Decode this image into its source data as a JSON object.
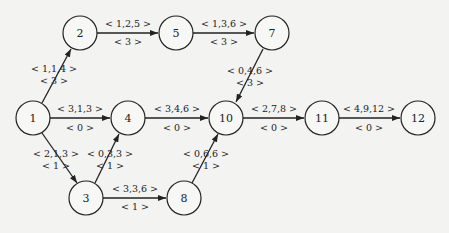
{
  "diagram": {
    "type": "activity-network",
    "nodes": [
      {
        "id": "1",
        "label": "1",
        "x": 33,
        "y": 118
      },
      {
        "id": "2",
        "label": "2",
        "x": 80,
        "y": 33
      },
      {
        "id": "3",
        "label": "3",
        "x": 86,
        "y": 198
      },
      {
        "id": "4",
        "label": "4",
        "x": 128,
        "y": 118
      },
      {
        "id": "5",
        "label": "5",
        "x": 176,
        "y": 33
      },
      {
        "id": "7",
        "label": "7",
        "x": 272,
        "y": 33
      },
      {
        "id": "8",
        "label": "8",
        "x": 184,
        "y": 198
      },
      {
        "id": "10",
        "label": "10",
        "x": 226,
        "y": 118
      },
      {
        "id": "11",
        "label": "11",
        "x": 322,
        "y": 118
      },
      {
        "id": "12",
        "label": "12",
        "x": 418,
        "y": 118
      }
    ],
    "edges": [
      {
        "from": "1",
        "to": "2",
        "label1": "< 1,1,4 >",
        "label2": "< 3 >"
      },
      {
        "from": "2",
        "to": "5",
        "label1": "< 1,2,5 >",
        "label2": "< 3 >"
      },
      {
        "from": "5",
        "to": "7",
        "label1": "< 1,3,6 >",
        "label2": "< 3 >"
      },
      {
        "from": "7",
        "to": "10",
        "label1": "< 0,4,6 >",
        "label2": "< 3 >"
      },
      {
        "from": "1",
        "to": "4",
        "label1": "< 3,1,3 >",
        "label2": "< 0 >"
      },
      {
        "from": "4",
        "to": "10",
        "label1": "< 3,4,6 >",
        "label2": "< 0 >"
      },
      {
        "from": "10",
        "to": "11",
        "label1": "< 2,7,8 >",
        "label2": "< 0 >"
      },
      {
        "from": "11",
        "to": "12",
        "label1": "< 4,9,12 >",
        "label2": "< 0 >"
      },
      {
        "from": "1",
        "to": "3",
        "label1": "< 2,1,3 >",
        "label2": "< 1 >"
      },
      {
        "from": "3",
        "to": "4",
        "label1": "< 0,3,3 >",
        "label2": "< 1 >"
      },
      {
        "from": "3",
        "to": "8",
        "label1": "< 3,3,6 >",
        "label2": "< 1 >"
      },
      {
        "from": "8",
        "to": "10",
        "label1": "< 0,6,6 >",
        "label2": "< 1 >"
      }
    ]
  }
}
